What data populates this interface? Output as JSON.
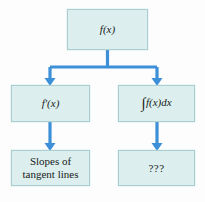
{
  "diagram": {
    "type": "flowchart",
    "title": "",
    "colors": {
      "box_fill": "#dcefee",
      "box_border": "#a9cfd0",
      "connector": "#3d90d8",
      "background": "#fdfdfe",
      "text": "#1a1a1a"
    },
    "nodes": [
      {
        "id": "fx",
        "label": "f(x)",
        "math_parts": {
          "func": "f",
          "open": "(",
          "var": "x",
          "close": ")"
        },
        "level": "top"
      },
      {
        "id": "fprime",
        "label": "f′(x)",
        "math_parts": {
          "func": "f′",
          "open": "(",
          "var": "x",
          "close": ")"
        },
        "level": "middle-left"
      },
      {
        "id": "integral",
        "label": "∫f(x)dx",
        "math_parts": {
          "integral": "∫",
          "func": "f",
          "open": "(",
          "var": "x",
          "close": ")",
          "differential": "dx"
        },
        "level": "middle-right"
      },
      {
        "id": "slopes",
        "label": "Slopes of tangent lines",
        "line1": "Slopes of",
        "line2": "tangent lines",
        "level": "bottom-left"
      },
      {
        "id": "unknown",
        "label": "???",
        "level": "bottom-right"
      }
    ],
    "edges": [
      {
        "from": "fx",
        "to": "fprime",
        "style": "elbow-arrow"
      },
      {
        "from": "fx",
        "to": "integral",
        "style": "elbow-arrow"
      },
      {
        "from": "fprime",
        "to": "slopes",
        "style": "straight-arrow"
      },
      {
        "from": "integral",
        "to": "unknown",
        "style": "straight-arrow"
      }
    ]
  }
}
